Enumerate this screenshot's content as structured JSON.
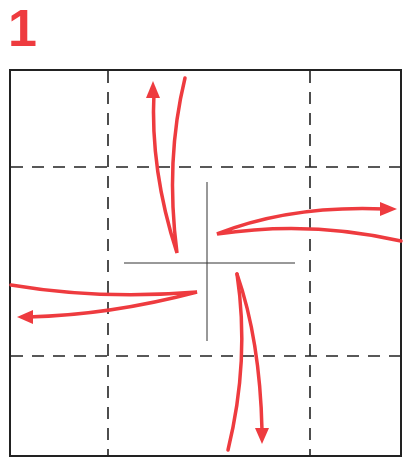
{
  "step": {
    "number": "1"
  },
  "colors": {
    "arrow": "#ee3b3f",
    "line": "#222222",
    "background": "#ffffff"
  },
  "diagram": {
    "type": "origami-fold-step",
    "square": {
      "x": 10,
      "y": 70,
      "width": 391,
      "height": 386
    },
    "dashed_lines": {
      "vertical": [
        108,
        310
      ],
      "horizontal": [
        167,
        356
      ]
    },
    "center_cut": {
      "cx": 207,
      "cy": 263,
      "h_from": 124,
      "h_to": 295,
      "v_from": 182,
      "v_to": 341
    },
    "arrows": [
      {
        "name": "up",
        "direction": "up"
      },
      {
        "name": "right",
        "direction": "right"
      },
      {
        "name": "left",
        "direction": "left"
      },
      {
        "name": "down",
        "direction": "down"
      }
    ]
  }
}
